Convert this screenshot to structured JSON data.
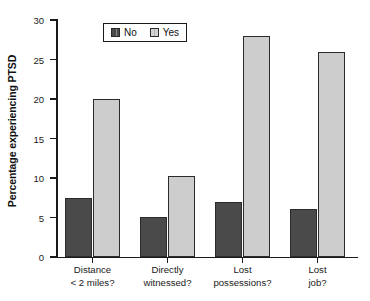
{
  "chart_data": {
    "type": "bar",
    "title": "",
    "xlabel": "",
    "ylabel": "Percentage experiencing PTSD",
    "ylim": [
      0,
      30
    ],
    "yticks": [
      0,
      5,
      10,
      15,
      20,
      25,
      30
    ],
    "ytick_labels": [
      "0",
      "5",
      "10",
      "15",
      "20",
      "25",
      "30"
    ],
    "grid": false,
    "legend_position": "top-center",
    "categories": [
      {
        "line1": "Distance",
        "line2": "< 2 miles?"
      },
      {
        "line1": "Directly",
        "line2": "witnessed?"
      },
      {
        "line1": "Lost",
        "line2": "possessions?"
      },
      {
        "line1": "Lost",
        "line2": "job?"
      }
    ],
    "series": [
      {
        "name": "No",
        "color": "#4a4a4a",
        "values": [
          7.5,
          5.1,
          7.0,
          6.1
        ]
      },
      {
        "name": "Yes",
        "color": "#cdcdcd",
        "values": [
          20.0,
          10.2,
          28.0,
          26.0
        ]
      }
    ]
  },
  "legend": {
    "entries": [
      {
        "label": "No",
        "swatch": "dark-gray-swatch-icon"
      },
      {
        "label": "Yes",
        "swatch": "light-gray-swatch-icon"
      }
    ]
  },
  "axes": {
    "y_title": "Percentage experiencing PTSD"
  }
}
